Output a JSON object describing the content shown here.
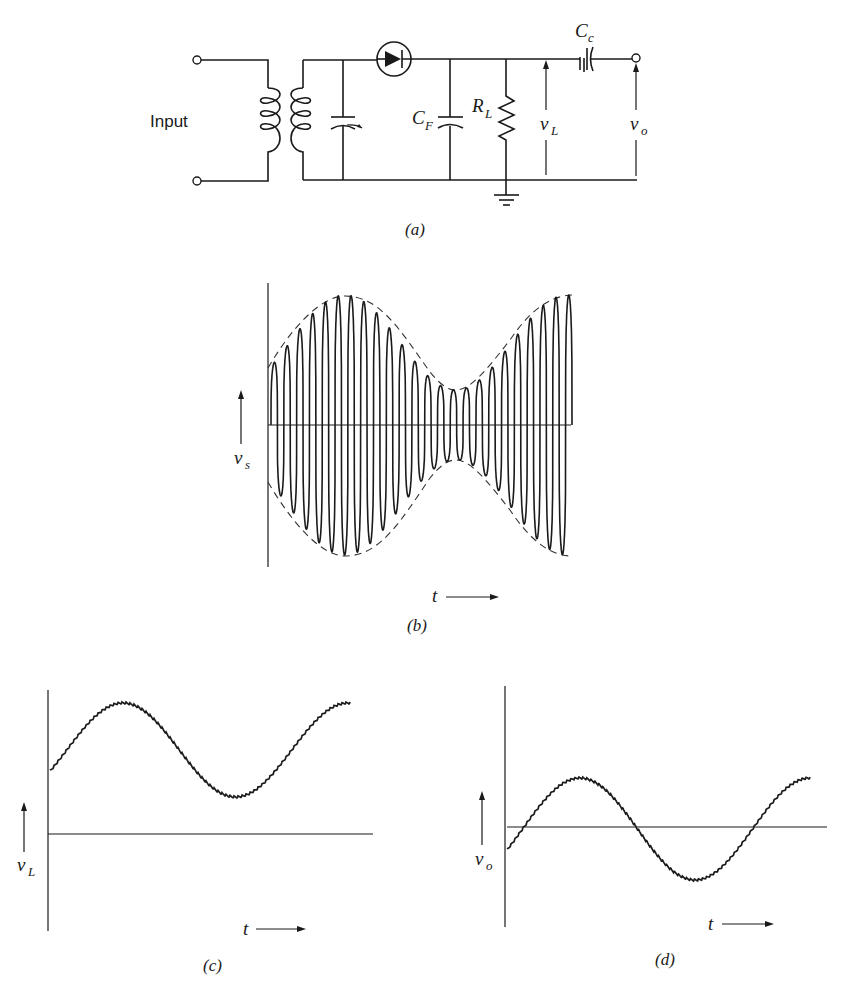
{
  "figure": {
    "panels": {
      "a": {
        "caption": "(a)",
        "input_label": "Input",
        "components": {
          "filter_capacitor": {
            "symbol": "C",
            "subscript": "F"
          },
          "load_resistor": {
            "symbol": "R",
            "subscript": "L"
          },
          "coupling_capacitor": {
            "symbol": "C",
            "subscript": "c"
          },
          "load_voltage": {
            "symbol": "v",
            "subscript": "L"
          },
          "output_voltage": {
            "symbol": "v",
            "subscript": "o"
          }
        }
      },
      "b": {
        "caption": "(b)",
        "y_label": {
          "symbol": "v",
          "subscript": "s"
        },
        "x_label": "t"
      },
      "c": {
        "caption": "(c)",
        "y_label": {
          "symbol": "v",
          "subscript": "L"
        },
        "x_label": "t"
      },
      "d": {
        "caption": "(d)",
        "y_label": {
          "symbol": "v",
          "subscript": "o"
        },
        "x_label": "t"
      }
    },
    "colors": {
      "ink": "#1a1a1a",
      "background": "#ffffff"
    }
  }
}
